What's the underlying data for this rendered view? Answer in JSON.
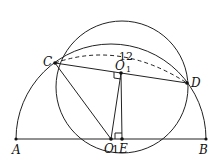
{
  "diagram": {
    "title": "",
    "points": {
      "A": "A",
      "B": "B",
      "C": "C",
      "D": "D",
      "O": "O",
      "E": "E",
      "O1": "O",
      "O1_sub": "1"
    },
    "annotations": {
      "arc_label": "12",
      "tick": "1"
    }
  }
}
